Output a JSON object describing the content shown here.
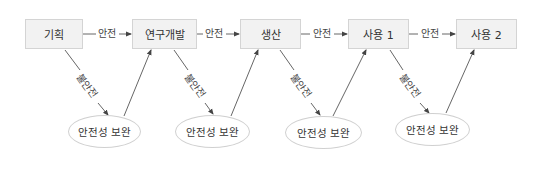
{
  "diagram": {
    "stages": [
      {
        "label": "기획"
      },
      {
        "label": "연구개발"
      },
      {
        "label": "생산"
      },
      {
        "label": "사용 1"
      },
      {
        "label": "사용 2"
      }
    ],
    "safe_edge_label": "안전",
    "unsafe_edge_label": "불안전",
    "remedy_nodes": [
      {
        "label": "안전성 보완"
      },
      {
        "label": "안전성 보완"
      },
      {
        "label": "안전성 보완"
      },
      {
        "label": "안전성 보완"
      }
    ],
    "safe_edges": [
      {
        "label": "안전",
        "from": "기획",
        "to": "연구개발"
      },
      {
        "label": "안전",
        "from": "연구개발",
        "to": "생산"
      },
      {
        "label": "안전",
        "from": "생산",
        "to": "사용 1"
      },
      {
        "label": "안전",
        "from": "사용 1",
        "to": "사용 2"
      }
    ],
    "unsafe_edges": [
      {
        "label": "불안전",
        "from": "기획",
        "to": "안전성 보완"
      },
      {
        "label": "불안전",
        "from": "연구개발",
        "to": "안전성 보완"
      },
      {
        "label": "불안전",
        "from": "생산",
        "to": "안전성 보완"
      },
      {
        "label": "불안전",
        "from": "사용 1",
        "to": "안전성 보완"
      }
    ],
    "colors": {
      "box_fill": "#f2f2f2",
      "box_border": "#d4d4d4",
      "line": "#555555",
      "text": "#333333"
    }
  }
}
